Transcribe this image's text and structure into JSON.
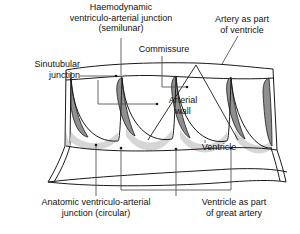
{
  "figure": {
    "type": "anatomical-diagram",
    "subject": "Ventriculo-arterial junction",
    "background_color": "#ffffff",
    "line_color": "#1a1a1a",
    "leaflet_fill": "#8c8c8c",
    "lunule_fill": "#d4d4d4",
    "leader_color": "#555555"
  },
  "labels": {
    "haemodynamic": "Haemodynamic\nventriculo-arterial junction\n(semilunar)",
    "commissure": "Commissure",
    "artery_as_part_of_ventricle": "Artery as part\nof ventricle",
    "sinutubular_junction": "Sinutubular\njunction",
    "arterial_wall": "Arterial\nwall",
    "ventricle": "Ventricle",
    "anatomic": "Anatomic ventriculo-arterial\njunction (circular)",
    "ventricle_as_part_of_great_artery": "Ventricle as part\nof great artery"
  }
}
